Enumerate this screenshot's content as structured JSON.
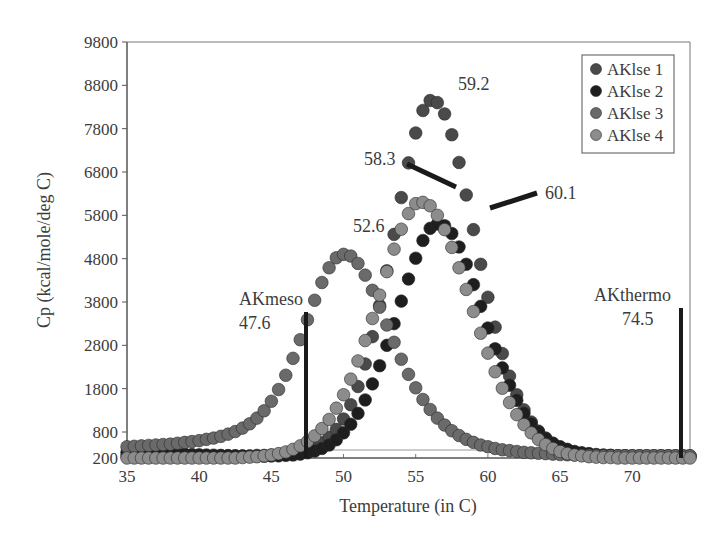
{
  "chart_data": {
    "type": "scatter",
    "title": "",
    "xlabel": "Temperature (in C)",
    "ylabel": "Cp (kcal/mole/deg C)",
    "xlim": [
      35,
      74
    ],
    "ylim": [
      200,
      9800
    ],
    "xticks": [
      35,
      40,
      45,
      50,
      55,
      60,
      65,
      70
    ],
    "yticks": [
      200,
      800,
      1800,
      2800,
      3800,
      4800,
      5800,
      6800,
      7800,
      8800,
      9800
    ],
    "grid": false,
    "legend_position": "top-right",
    "x_step": 0.5,
    "x_start": 35,
    "series": [
      {
        "name": "AKlse 1",
        "color": "#4a4a4a",
        "peak_T": 59.2,
        "peak_Cp": 8450,
        "values": [
          250,
          250,
          250,
          250,
          250,
          250,
          250,
          250,
          250,
          250,
          250,
          250,
          250,
          250,
          250,
          250,
          250,
          250,
          260,
          260,
          270,
          280,
          300,
          320,
          350,
          400,
          460,
          550,
          680,
          860,
          1100,
          1430,
          1850,
          2370,
          3000,
          3720,
          4520,
          5360,
          6210,
          7010,
          7700,
          8220,
          8450,
          8400,
          8140,
          7660,
          7020,
          6270,
          5470,
          4670,
          3910,
          3220,
          2610,
          2090,
          1660,
          1310,
          1030,
          820,
          660,
          540,
          450,
          390,
          340,
          310,
          290,
          270,
          260,
          260,
          250,
          250,
          250,
          250,
          250,
          250,
          250,
          250,
          250,
          250,
          250
        ]
      },
      {
        "name": "AKlse 2",
        "color": "#1e1e1e",
        "peak_T": 60.1,
        "peak_Cp": 5600,
        "values": [
          330,
          330,
          325,
          320,
          315,
          310,
          300,
          295,
          290,
          280,
          275,
          270,
          265,
          260,
          255,
          250,
          245,
          240,
          240,
          240,
          245,
          250,
          260,
          270,
          290,
          320,
          360,
          420,
          500,
          620,
          780,
          980,
          1230,
          1540,
          1910,
          2330,
          2800,
          3300,
          3820,
          4330,
          4810,
          5220,
          5500,
          5600,
          5560,
          5380,
          5070,
          4670,
          4200,
          3700,
          3200,
          2720,
          2280,
          1880,
          1530,
          1230,
          990,
          800,
          650,
          540,
          460,
          400,
          350,
          320,
          300,
          280,
          270,
          260,
          250,
          250,
          240,
          240,
          240,
          240,
          240,
          240,
          240,
          240,
          240
        ]
      },
      {
        "name": "AKlse 3",
        "color": "#6a6a6a",
        "peak_T": 52.6,
        "peak_Cp": 4900,
        "values": [
          460,
          470,
          480,
          490,
          500,
          510,
          520,
          540,
          560,
          580,
          600,
          630,
          660,
          700,
          750,
          810,
          890,
          990,
          1120,
          1290,
          1510,
          1780,
          2110,
          2500,
          2930,
          3390,
          3840,
          4250,
          4590,
          4820,
          4900,
          4860,
          4690,
          4420,
          4070,
          3680,
          3270,
          2870,
          2480,
          2130,
          1820,
          1550,
          1320,
          1120,
          960,
          830,
          720,
          630,
          560,
          500,
          460,
          420,
          390,
          370,
          350,
          330,
          320,
          310,
          300,
          290,
          280,
          275,
          270,
          265,
          260,
          255,
          250,
          250,
          250,
          250,
          250,
          250,
          250,
          250,
          250,
          250,
          250,
          250,
          250
        ]
      },
      {
        "name": "AKlse 4",
        "color": "#8c8c8c",
        "peak_T": 58.3,
        "peak_Cp": 6100,
        "values": [
          200,
          200,
          200,
          200,
          200,
          200,
          200,
          200,
          200,
          200,
          200,
          200,
          200,
          200,
          200,
          200,
          210,
          220,
          230,
          250,
          270,
          300,
          340,
          400,
          480,
          580,
          710,
          880,
          1090,
          1350,
          1660,
          2020,
          2440,
          2910,
          3420,
          3960,
          4500,
          5020,
          5480,
          5840,
          6070,
          6100,
          6020,
          5800,
          5470,
          5060,
          4590,
          4090,
          3580,
          3080,
          2620,
          2190,
          1810,
          1480,
          1200,
          970,
          780,
          630,
          510,
          420,
          350,
          300,
          270,
          250,
          230,
          220,
          210,
          210,
          200,
          200,
          200,
          200,
          200,
          200,
          200,
          200,
          200,
          200,
          200
        ]
      }
    ],
    "annotations": [
      {
        "text": "59.2",
        "target": "AKlse 1 peak"
      },
      {
        "text": "58.3",
        "target": "AKlse 4 peak"
      },
      {
        "text": "60.1",
        "target": "AKlse 2 peak"
      },
      {
        "text": "52.6",
        "target": "AKlse 3 peak"
      },
      {
        "text": "AKmeso",
        "sub": "47.6",
        "vline_x": 47.6
      },
      {
        "text": "AKthermo",
        "sub": "74.5",
        "vline_x": 73.7
      }
    ]
  },
  "legend": {
    "items": [
      {
        "label": "AKlse 1",
        "color": "#4a4a4a"
      },
      {
        "label": "AKlse 2",
        "color": "#1e1e1e"
      },
      {
        "label": "AKlse 3",
        "color": "#6a6a6a"
      },
      {
        "label": "AKlse 4",
        "color": "#8c8c8c"
      }
    ]
  },
  "labels": {
    "peak1": "59.2",
    "peak4": "58.3",
    "peak2": "60.1",
    "peak3": "52.6",
    "meso_name": "AKmeso",
    "meso_value": "47.6",
    "thermo_name": "AKthermo",
    "thermo_value": "74.5",
    "xlabel": "Temperature (in C)",
    "ylabel": "Cp (kcal/mole/deg C)"
  }
}
